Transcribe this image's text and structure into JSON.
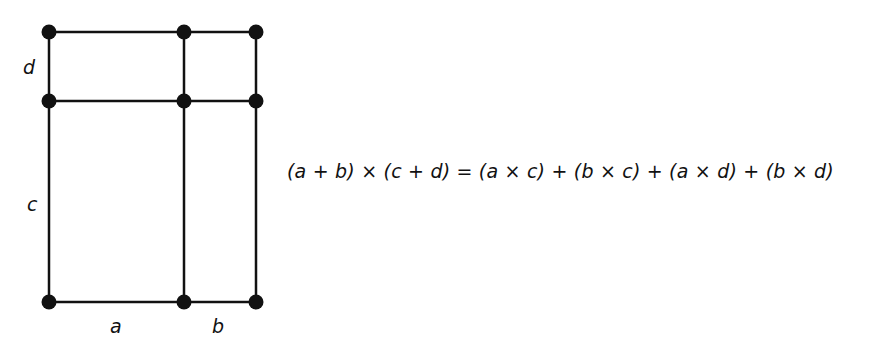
{
  "diagram": {
    "type": "area-model-grid",
    "labels": {
      "d": "d",
      "c": "c",
      "a": "a",
      "b": "b"
    },
    "nodes": [
      {
        "x": 49,
        "y": 32
      },
      {
        "x": 184,
        "y": 32
      },
      {
        "x": 256,
        "y": 32
      },
      {
        "x": 49,
        "y": 101
      },
      {
        "x": 184,
        "y": 101
      },
      {
        "x": 256,
        "y": 101
      },
      {
        "x": 49,
        "y": 302
      },
      {
        "x": 184,
        "y": 302
      },
      {
        "x": 256,
        "y": 302
      }
    ],
    "line_color": "#111111"
  },
  "equation": "(a + b) × (c + d) = (a × c) + (b × c) + (a × d) + (b × d)"
}
